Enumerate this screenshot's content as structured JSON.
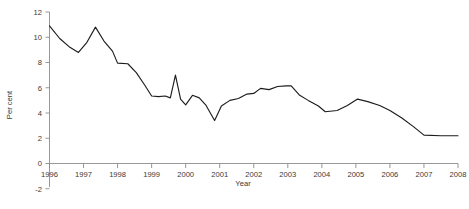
{
  "chart_data": {
    "type": "line",
    "title": "",
    "subtitle": "",
    "xlabel": "Year",
    "ylabel": "Per cent",
    "xlim": [
      1996,
      2008
    ],
    "ylim": [
      -2,
      12
    ],
    "grid": false,
    "legend": null,
    "legend_position": "none",
    "y_ticks": [
      12,
      10,
      8,
      6,
      4,
      2,
      0,
      -2
    ],
    "x_ticks": [
      1996,
      1997,
      1998,
      1999,
      2000,
      2001,
      2002,
      2003,
      2004,
      2005,
      2006,
      2007,
      2008
    ],
    "series": [
      {
        "name": "Per cent",
        "color": "#1d1d1d",
        "x": [
          1996.0,
          1996.25,
          1996.5,
          1996.75,
          1997.0,
          1997.25,
          1997.5,
          1997.75,
          1998.0,
          1998.25,
          1998.5,
          1998.75,
          1999.0,
          1999.25,
          1999.5,
          1999.75,
          2000.0,
          2000.25,
          2000.5,
          2000.75,
          2001.0,
          2001.25,
          2001.5,
          2001.75,
          2002.0,
          2002.25,
          2002.5,
          2002.75,
          2003.0,
          2003.25,
          2003.5,
          2003.75,
          2004.0,
          2004.25,
          2004.5,
          2004.75,
          2005.0,
          2005.25,
          2005.5,
          2005.75,
          2006.0,
          2006.25,
          2006.5,
          2006.75,
          2007.0,
          2007.25,
          2007.5,
          2007.75,
          2008.0
        ],
        "values": [
          10.9,
          10.1,
          9.3,
          8.8,
          9.4,
          10.1,
          10.8,
          9.9,
          8.9,
          7.9,
          7.9,
          7.3,
          6.3,
          5.4,
          5.3,
          5.3,
          5.4,
          5.3,
          7.0,
          5.1,
          4.7,
          5.5,
          5.3,
          4.6,
          3.4,
          4.6,
          5.2,
          5.3,
          5.4,
          5.8,
          6.1,
          6.0,
          6.1,
          6.2,
          6.3,
          6.3,
          6.0,
          5.6,
          5.3,
          5.0,
          4.6,
          4.1,
          4.2,
          4.6,
          5.1,
          4.9,
          4.6,
          4.1,
          3.5
        ]
      },
      {
        "name": "Per cent (tail)",
        "color": "#1d1d1d",
        "x": [
          2007.5,
          2007.75,
          2008.0
        ],
        "values": [
          2.2,
          2.2,
          2.2
        ]
      }
    ],
    "path_points": [
      [
        1996.0,
        10.9
      ],
      [
        1996.3,
        9.9
      ],
      [
        1996.6,
        9.2
      ],
      [
        1996.85,
        8.8
      ],
      [
        1997.1,
        9.6
      ],
      [
        1997.35,
        10.8
      ],
      [
        1997.6,
        9.7
      ],
      [
        1997.85,
        8.9
      ],
      [
        1998.0,
        7.95
      ],
      [
        1998.3,
        7.9
      ],
      [
        1998.55,
        7.2
      ],
      [
        1998.8,
        6.2
      ],
      [
        1999.0,
        5.35
      ],
      [
        1999.2,
        5.3
      ],
      [
        1999.4,
        5.35
      ],
      [
        1999.55,
        5.2
      ],
      [
        1999.7,
        7.0
      ],
      [
        1999.85,
        5.1
      ],
      [
        2000.0,
        4.65
      ],
      [
        2000.2,
        5.4
      ],
      [
        2000.4,
        5.2
      ],
      [
        2000.6,
        4.6
      ],
      [
        2000.85,
        3.4
      ],
      [
        2001.05,
        4.55
      ],
      [
        2001.3,
        5.0
      ],
      [
        2001.55,
        5.15
      ],
      [
        2001.8,
        5.5
      ],
      [
        2002.0,
        5.55
      ],
      [
        2002.2,
        5.95
      ],
      [
        2002.45,
        5.85
      ],
      [
        2002.7,
        6.1
      ],
      [
        2002.95,
        6.15
      ],
      [
        2003.1,
        6.15
      ],
      [
        2003.35,
        5.4
      ],
      [
        2003.6,
        5.0
      ],
      [
        2003.9,
        4.55
      ],
      [
        2004.1,
        4.1
      ],
      [
        2004.45,
        4.2
      ],
      [
        2004.75,
        4.6
      ],
      [
        2005.05,
        5.1
      ],
      [
        2005.35,
        4.9
      ],
      [
        2005.7,
        4.6
      ],
      [
        2006.0,
        4.2
      ],
      [
        2006.35,
        3.6
      ],
      [
        2006.7,
        2.9
      ],
      [
        2007.0,
        2.25
      ],
      [
        2007.5,
        2.2
      ],
      [
        2008.0,
        2.2
      ]
    ]
  },
  "axes": {
    "y_title": "Per cent",
    "x_title": "Year",
    "y_tick_labels": [
      "12",
      "10",
      "8",
      "6",
      "4",
      "2",
      "0",
      "-2"
    ],
    "x_tick_labels": [
      "1996",
      "1997",
      "1998",
      "1999",
      "2000",
      "2001",
      "2002",
      "2003",
      "2004",
      "2005",
      "2006",
      "2007",
      "2008"
    ]
  },
  "colors": {
    "line": "#1d1d1d",
    "axis": "#8c8c8c",
    "text": "#3a3a3a",
    "background": "#ffffff"
  }
}
